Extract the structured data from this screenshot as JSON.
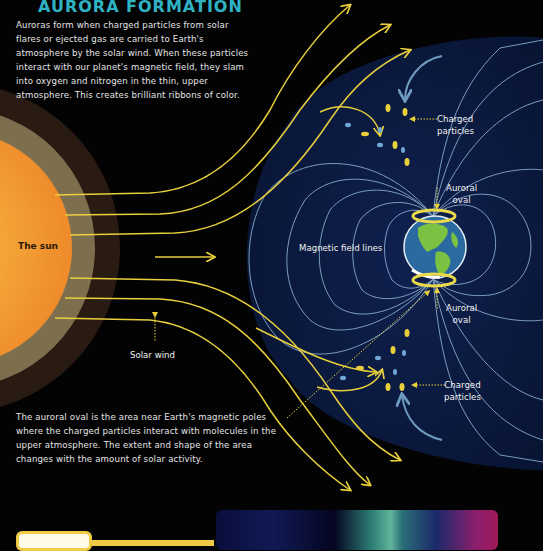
{
  "title": "AURORA FORMATION",
  "intro_text": "Auroras form when charged particles from solar flares or ejected gas are carried to Earth's atmosphere by the solar wind. When these particles interact with our planet's magnetic field, they slam into oxygen and nitrogen in the thin, upper atmosphere. This creates brilliant ribbons of color.",
  "labels": {
    "sun": "The sun",
    "solar_wind": "Solar wind",
    "magnetic_field_lines": "Magnetic field lines",
    "charged_particles_top_1": "Charged",
    "charged_particles_top_2": "particles",
    "auroral_oval_top_1": "Auroral",
    "auroral_oval_top_2": "oval",
    "auroral_oval_bottom_1": "Auroral",
    "auroral_oval_bottom_2": "oval",
    "charged_particles_bottom_1": "Charged",
    "charged_particles_bottom_2": "particles"
  },
  "outro_text": "The auroral oval is the area near Earth's magnetic poles where the charged particles interact with molecules in the upper atmosphere. The extent and shape of the area changes with the amount of solar activity.",
  "colors": {
    "background": "#030304",
    "title": "#2fb3c4",
    "solar_wind": "#e8cf3c",
    "magnetosphere": "#0b1a40",
    "field_lines": "#8fb4d6",
    "sun_core": "#f29a2e",
    "sun_ring_inner": "#7d6f4d",
    "sun_ring_outer": "#2a1b12",
    "earth_ocean": "#2b6aa0",
    "earth_land": "#7cc242",
    "aurora_oval": "#e8d84a"
  }
}
